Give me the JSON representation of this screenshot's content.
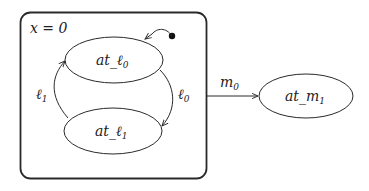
{
  "diagram": {
    "type": "statechart",
    "composite_state": {
      "label": "x = 0",
      "states": [
        {
          "id": "at_l0",
          "label_base": "at_ℓ",
          "label_sub": "0",
          "initial": true
        },
        {
          "id": "at_l1",
          "label_base": "at_ℓ",
          "label_sub": "1"
        }
      ],
      "transitions": [
        {
          "from": "at_l0",
          "to": "at_l1",
          "label_base": "ℓ",
          "label_sub": "0"
        },
        {
          "from": "at_l1",
          "to": "at_l0",
          "label_base": "ℓ",
          "label_sub": "1"
        }
      ]
    },
    "external_states": [
      {
        "id": "at_m1",
        "label_base": "at_m",
        "label_sub": "1"
      }
    ],
    "external_transitions": [
      {
        "from": "composite",
        "to": "at_m1",
        "label_base": "m",
        "label_sub": "0"
      }
    ],
    "colors": {
      "stroke": "#2a2a2a",
      "background": "#ffffff"
    }
  }
}
